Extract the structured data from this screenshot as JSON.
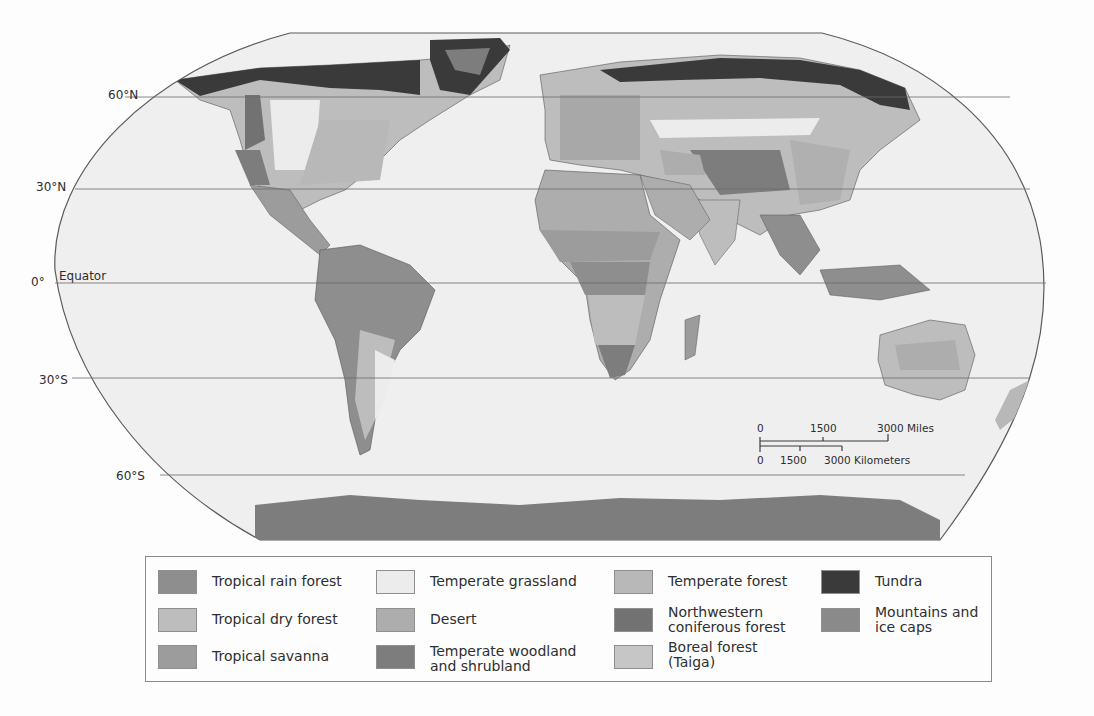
{
  "map": {
    "title": "World biomes",
    "latitude_labels": [
      {
        "label": "60°N",
        "y": 97
      },
      {
        "label": "30°N",
        "y": 189
      },
      {
        "label": "0°",
        "y": 283
      },
      {
        "label": "30°S",
        "y": 378
      },
      {
        "label": "60°S",
        "y": 475
      }
    ],
    "equator_label": "Equator",
    "colors": {
      "ocean": "#efefef",
      "outline": "#5a5a5a",
      "gridline": "#6a6a6a"
    }
  },
  "scale_bar": {
    "miles": {
      "ticks": [
        "0",
        "1500",
        "3000 Miles"
      ]
    },
    "kilometers": {
      "ticks": [
        "0",
        "1500",
        "3000 Kilometers"
      ]
    }
  },
  "legend": {
    "items": [
      {
        "label": "Tropical rain forest",
        "color": "#8e8e8e"
      },
      {
        "label": "Tropical dry forest",
        "color": "#bdbdbd"
      },
      {
        "label": "Tropical savanna",
        "color": "#9c9c9c"
      },
      {
        "label": "Temperate grassland",
        "color": "#ececec"
      },
      {
        "label": "Desert",
        "color": "#adadad"
      },
      {
        "label": "Temperate woodland\nand shrubland",
        "color": "#7d7d7d"
      },
      {
        "label": "Temperate forest",
        "color": "#b8b8b8"
      },
      {
        "label": "Northwestern\nconiferous forest",
        "color": "#727272"
      },
      {
        "label": "Boreal forest\n(Taiga)",
        "color": "#c6c6c6"
      },
      {
        "label": "Tundra",
        "color": "#3a3a3a"
      },
      {
        "label": "Mountains and\nice caps",
        "color": "#8a8a8a"
      }
    ]
  }
}
